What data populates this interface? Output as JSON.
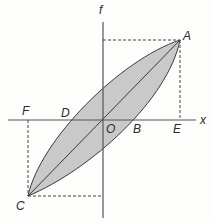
{
  "diagram": {
    "type": "hysteresis-loop",
    "axes": {
      "vertical_label": "f",
      "horizontal_label": "x"
    },
    "points": {
      "A": "A",
      "B": "B",
      "C": "C",
      "D": "D",
      "E": "E",
      "F": "F",
      "O": "O"
    },
    "colors": {
      "fill": "#c8c8c8",
      "stroke": "#3a3a3a",
      "axis": "#444444",
      "dashed": "#444444"
    }
  }
}
